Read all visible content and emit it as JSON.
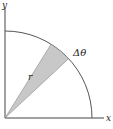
{
  "diagram": {
    "type": "polar-sector",
    "axes": {
      "x_label": "x",
      "y_label": "y"
    },
    "labels": {
      "radius": "r",
      "angle": "Δθ"
    },
    "colors": {
      "line": "#555555",
      "axis": "#444444",
      "wedge_fill": "#c8c8c8",
      "wedge_edge": "#888888",
      "text": "#222222"
    },
    "geometry": {
      "origin": [
        5,
        118
      ],
      "radius_px": 87,
      "wedge_start_deg": 43,
      "wedge_end_deg": 58
    }
  }
}
